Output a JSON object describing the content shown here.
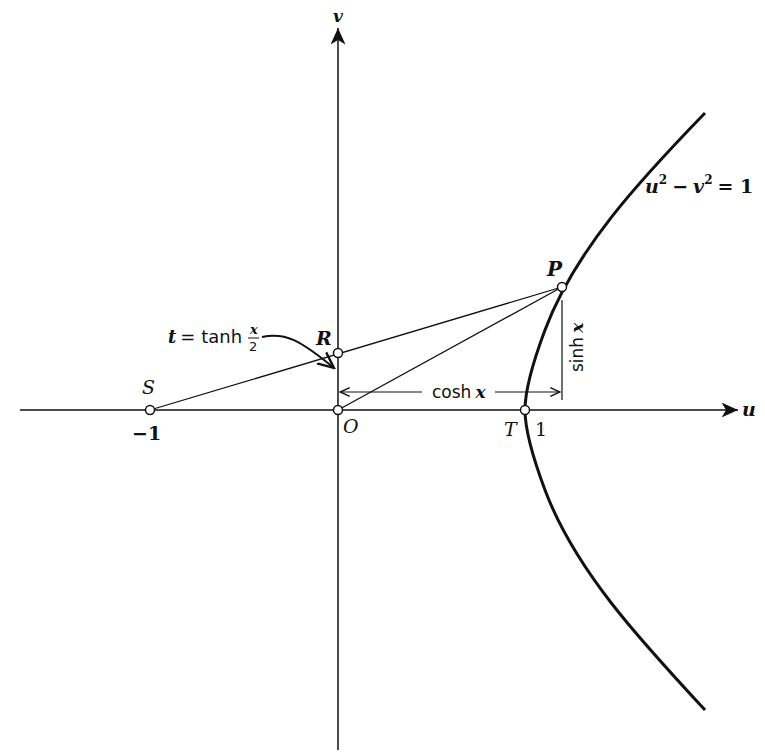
{
  "diagram": {
    "axes": {
      "horizontal": {
        "label": "u"
      },
      "vertical": {
        "label": "v"
      }
    },
    "curve": {
      "equation": "u² − v² = 1",
      "eq_u": "u",
      "eq_minus": "−",
      "eq_v": "v",
      "eq_sup": "2",
      "eq_rhs": "= 1"
    },
    "points": {
      "S": {
        "label": "S",
        "coord_label": "−1"
      },
      "O": {
        "label": "O"
      },
      "R": {
        "label": "R"
      },
      "T": {
        "label": "T",
        "coord_label": "1"
      },
      "P": {
        "label": "P"
      }
    },
    "annotations": {
      "t_def_lhs": "t = tanh",
      "t_def_num": "x",
      "t_def_den": "2",
      "cosh": "cosh x",
      "cosh_fn": "cosh",
      "cosh_var": "x",
      "sinh": "sinh x",
      "sinh_fn": "sinh",
      "sinh_var": "x"
    },
    "colors": {
      "ink": "#111111",
      "background": "#ffffff"
    }
  }
}
